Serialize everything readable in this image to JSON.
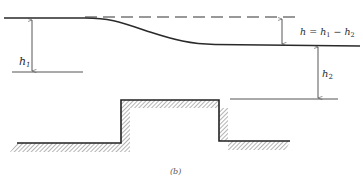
{
  "figure": {
    "caption": "(b)"
  },
  "labels": {
    "h1": {
      "base": "h",
      "sub": "1"
    },
    "h2": {
      "base": "h",
      "sub": "2"
    },
    "h_eq": {
      "lhs": "h",
      "eq": " = ",
      "t1": "h",
      "s1": "1",
      "minus": " − ",
      "t2": "h",
      "s2": "2"
    }
  },
  "colors": {
    "line": "#2a2a2a",
    "thin_line": "#555555",
    "hatch": "#6a6a6a",
    "background": "#ffffff"
  },
  "geometry": {
    "upstream_surface_y": 18,
    "downstream_surface_y": 45,
    "dashed_reference_y": 17,
    "left_datum_y": 72,
    "right_datum_y": 99,
    "step_top_y": 100,
    "left_floor_y": 143,
    "right_floor_y": 141,
    "step_left_x": 121,
    "step_right_x": 219
  }
}
